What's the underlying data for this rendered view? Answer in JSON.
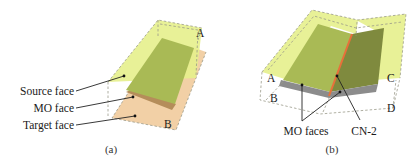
{
  "figure": {
    "panels": [
      {
        "id": "a",
        "caption": "(a)",
        "labels": {
          "source_face": "Source face",
          "mo_face": "MO face",
          "target_face": "Target face",
          "corner_a": "A",
          "corner_b": "B"
        }
      },
      {
        "id": "b",
        "caption": "(b)",
        "labels": {
          "mo_faces": "MO faces",
          "cn2": "CN-2",
          "corner_a": "A",
          "corner_b": "B",
          "corner_c": "C",
          "corner_d": "D"
        }
      }
    ],
    "colors": {
      "source_face": "#e6ef8c",
      "mo_overlap_green": "#a9ba55",
      "mo_overlap_dark_green": "#7f8a3e",
      "target_face": "#f0c896",
      "mo_face_brown": "#b58d5a",
      "mo_faces_gray": "#8c8c8c",
      "cn2_edge": "#e8703a",
      "dashed_outline": "#9a9a8a"
    }
  }
}
